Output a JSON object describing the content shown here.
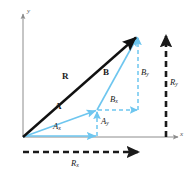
{
  "figure": {
    "type": "vector-diagram",
    "width": 192,
    "height": 182,
    "background": "#ffffff"
  },
  "colors": {
    "axis": "#8c8c8c",
    "vector_black": "#111111",
    "vector_light_blue": "#6ec6ef",
    "dashed_blue": "#6ec6ef",
    "dashed_black": "#1a1a1a",
    "label_text": "#1a1a1a",
    "axis_label_text": "#555555"
  },
  "axes": {
    "x_label": "x",
    "y_label": "y",
    "origin": {
      "x": 23,
      "y": 137
    },
    "x_axis_end": {
      "x": 180,
      "y": 137
    },
    "y_axis_top": {
      "x": 23,
      "y": 12
    }
  },
  "labels": {
    "resultant": "R",
    "vector_a": "A",
    "vector_b": "B",
    "a_x": "A",
    "a_x_sub": "x",
    "a_y": "A",
    "a_y_sub": "y",
    "b_x": "B",
    "b_x_sub": "x",
    "b_y": "B",
    "b_y_sub": "y",
    "r_x": "R",
    "r_x_sub": "x",
    "r_y": "R",
    "r_y_sub": "y"
  },
  "vectors": [
    {
      "name": "R",
      "label": "R",
      "style": "solid",
      "color": "#111111",
      "from": {
        "x": 23,
        "y": 137
      },
      "to": {
        "x": 138,
        "y": 35
      },
      "label_pos": {
        "x": 62,
        "y": 76
      }
    },
    {
      "name": "A",
      "label": "A",
      "style": "solid",
      "color": "#6ec6ef",
      "from": {
        "x": 23,
        "y": 137
      },
      "to": {
        "x": 97,
        "y": 110
      },
      "label_pos": {
        "x": 57,
        "y": 106
      }
    },
    {
      "name": "B",
      "label": "B",
      "style": "solid",
      "color": "#6ec6ef",
      "from": {
        "x": 97,
        "y": 110
      },
      "to": {
        "x": 138,
        "y": 35
      },
      "label_pos": {
        "x": 103,
        "y": 72
      }
    },
    {
      "name": "Ax",
      "label": "A_x",
      "style": "solid",
      "color": "#6ec6ef",
      "from": {
        "x": 23,
        "y": 137
      },
      "to": {
        "x": 97,
        "y": 137
      },
      "label_pos": {
        "x": 55,
        "y": 128
      }
    },
    {
      "name": "Ay",
      "label": "A_y",
      "style": "dashed",
      "color": "#6ec6ef",
      "from": {
        "x": 97,
        "y": 137
      },
      "to": {
        "x": 97,
        "y": 110
      },
      "label_pos": {
        "x": 101,
        "y": 121
      }
    },
    {
      "name": "Bx",
      "label": "B_x",
      "style": "dashed",
      "color": "#6ec6ef",
      "from": {
        "x": 97,
        "y": 110
      },
      "to": {
        "x": 138,
        "y": 110
      },
      "label_pos": {
        "x": 112,
        "y": 99
      }
    },
    {
      "name": "By",
      "label": "B_y",
      "style": "dashed",
      "color": "#6ec6ef",
      "from": {
        "x": 138,
        "y": 110
      },
      "to": {
        "x": 138,
        "y": 35
      },
      "label_pos": {
        "x": 142,
        "y": 72
      }
    },
    {
      "name": "Rx",
      "label": "R_x",
      "style": "dashed",
      "color": "#1a1a1a",
      "from": {
        "x": 23,
        "y": 152
      },
      "to": {
        "x": 140,
        "y": 152
      },
      "label_pos": {
        "x": 72,
        "y": 163
      }
    },
    {
      "name": "Ry",
      "label": "R_y",
      "style": "dashed",
      "color": "#1a1a1a",
      "from": {
        "x": 166,
        "y": 137
      },
      "to": {
        "x": 166,
        "y": 34
      },
      "label_pos": {
        "x": 170,
        "y": 82
      }
    }
  ]
}
